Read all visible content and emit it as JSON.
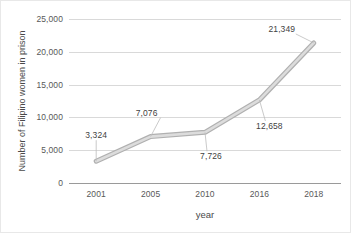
{
  "chart_data": {
    "type": "line",
    "title": "",
    "xlabel": "year",
    "ylabel": "Number of Filipino women in prison",
    "categories": [
      "2001",
      "2005",
      "2010",
      "2016",
      "2018"
    ],
    "values": [
      3324,
      7076,
      7726,
      12658,
      21349
    ],
    "data_labels": [
      "3,324",
      "7,076",
      "7,726",
      "12,658",
      "21,349"
    ],
    "series": [
      {
        "name": "Number of Filipino women in prison",
        "values": [
          3324,
          7076,
          7726,
          12658,
          21349
        ]
      }
    ],
    "ylim": [
      0,
      25000
    ],
    "yticks": [
      0,
      5000,
      10000,
      15000,
      20000,
      25000
    ],
    "ytick_labels": [
      "0",
      "5,000",
      "10,000",
      "15,000",
      "20,000",
      "25,000"
    ],
    "grid": true,
    "legend": false,
    "legend_position": "none",
    "line_color": "#c4c4c4",
    "grid_color": "#d9d9d9",
    "axis_color": "#9a9a9a",
    "text_color": "#585858"
  }
}
